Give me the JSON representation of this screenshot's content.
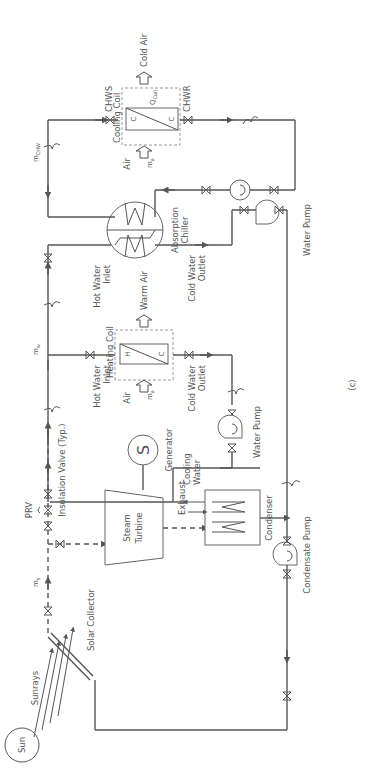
{
  "diagram": {
    "caption": "(c)",
    "orientation": "rotated-90-ccw",
    "components": {
      "sun": "Sun",
      "sunrays": "Sunrays",
      "solar_collector": "Solar Collector",
      "steam_flow": "ṁs",
      "steam_flow_base": "m",
      "steam_flow_sub": "s",
      "prv": "PRV",
      "isolation_valve": "Insolation Valve (Typ.)",
      "steam_turbine_line1": "Steam",
      "steam_turbine_line2": "Turbine",
      "generator": "Generator",
      "generator_symbol": "S",
      "exhaust": "Exhaust",
      "cooling_water_line1": "Cooling",
      "cooling_water_line2": "Water",
      "condenser": "Condenser",
      "condensate_pump": "Condensate Pump",
      "water_pump_1": "Water Pump",
      "water_pump_2": "Water Pump",
      "hot_water_flow_base": "m",
      "hot_water_flow_sub": "w",
      "hot_water_inlet_1_line1": "Hot Water",
      "hot_water_inlet_1_line2": "Inlet",
      "hot_water_inlet_2_line1": "Hot Water",
      "hot_water_inlet_2_line2": "Inlet",
      "heating_coil": "Heating Coil",
      "heating_coil_hot": "H",
      "heating_coil_cold": "C",
      "air_in_heating": "Air",
      "air_flow_base": "m",
      "air_flow_sub": "a",
      "warm_air": "Warm Air",
      "cold_water_outlet_1_line1": "Cold Water",
      "cold_water_outlet_1_line2": "Outlet",
      "cold_water_outlet_2_line1": "Cold Water",
      "cold_water_outlet_2_line2": "Outlet",
      "absorption_chiller_line1": "Absorption",
      "absorption_chiller_line2": "Chiller",
      "chw_flow_base": "m",
      "chw_flow_sub": "CHW",
      "chws": "CHWS",
      "chwr": "CHWR",
      "cooling_coil": "Cooling Coil",
      "cooling_coil_c1": "C",
      "cooling_coil_c2": "C",
      "q_coil_base": "Q",
      "q_coil_sub": "Coil",
      "air_in_cooling": "Air",
      "cold_air": "Cold Air"
    },
    "colors": {
      "line": "#555555",
      "text": "#555555",
      "dashed_box": "#999999",
      "background": "#ffffff"
    }
  }
}
